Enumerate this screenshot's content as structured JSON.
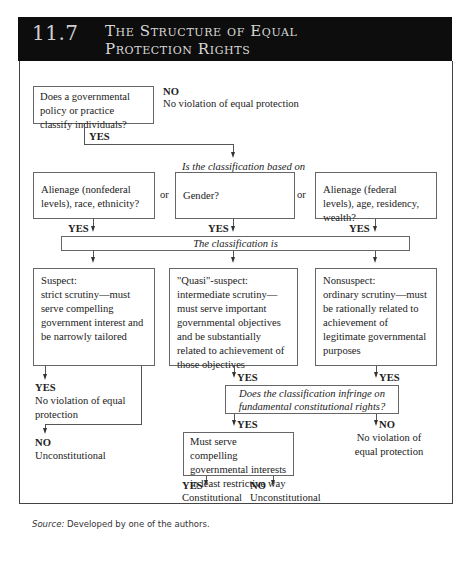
{
  "header": {
    "number": "11.7",
    "title_line1": "The Structure of Equal",
    "title_line2": "Protection Rights"
  },
  "q1": {
    "text": "Does a governmental policy or practice classify individuals?",
    "no_label": "NO",
    "no_result": "No violation of equal protection",
    "yes_label": "YES"
  },
  "q2": {
    "text": "Is the classification based on"
  },
  "categories": [
    {
      "text": "Alienage (nonfederal levels), race, ethnicity?",
      "yes": "YES"
    },
    {
      "text": "Gender?",
      "yes": "YES"
    },
    {
      "text": "Alienage (federal levels), age, residency, wealth?",
      "yes": "YES"
    }
  ],
  "or_label": "or",
  "classification_is": "The classification is",
  "levels": [
    {
      "title": "Suspect:",
      "text": "strict scrutiny—must serve compelling government interest and be narrowly tailored"
    },
    {
      "title": "\"Quasi\"-suspect:",
      "text": "intermediate scrutiny—must serve important governmental objectives and be substantially related to achievement of those objectives"
    },
    {
      "title": "Nonsuspect:",
      "text": "ordinary scrutiny—must be rationally related to achievement of legitimate governmental purposes"
    }
  ],
  "suspect_outcomes": {
    "yes_label": "YES",
    "yes_text": "No violation of equal protection",
    "no_label": "NO",
    "no_text": "Unconstitutional"
  },
  "mid_yes": "YES",
  "right_yes": "YES",
  "fundamental": {
    "text": "Does the classification infringe on fundamental constitutional rights?",
    "yes_label": "YES",
    "no_label": "NO",
    "no_text": "No violation of equal protection"
  },
  "compelling": {
    "text": "Must serve compelling governmental interests in least restrictive way",
    "yes_label": "YES",
    "yes_text": "Constitutional",
    "no_label": "NO",
    "no_text": "Unconstitutional"
  },
  "source": {
    "label": "Source:",
    "text": "Developed by one of the authors."
  }
}
